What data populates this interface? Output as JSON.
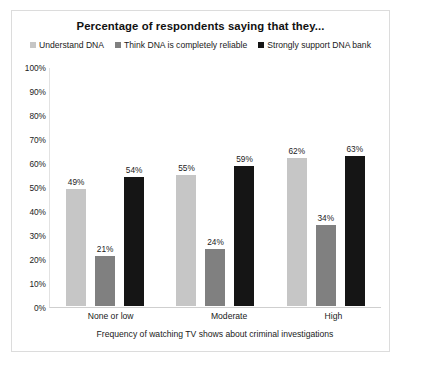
{
  "chart_data": {
    "type": "bar",
    "title": "Percentage of respondents saying that they...",
    "xlabel": "Frequency of watching TV shows about criminal investigations",
    "ylabel": "",
    "ylim": [
      0,
      100
    ],
    "grid": false,
    "legend_position": "top-center",
    "categories": [
      "None or low",
      "Moderate",
      "High"
    ],
    "y_ticks": [
      "100%",
      "90%",
      "80%",
      "70%",
      "60%",
      "50%",
      "40%",
      "30%",
      "20%",
      "10%",
      "0%"
    ],
    "series": [
      {
        "name": "Understand DNA",
        "color": "#c6c6c6",
        "values": [
          49,
          55,
          62
        ],
        "labels": [
          "49%",
          "55%",
          "62%"
        ]
      },
      {
        "name": "Think DNA is completely reliable",
        "color": "#808080",
        "values": [
          21,
          24,
          34
        ],
        "labels": [
          "21%",
          "24%",
          "34%"
        ]
      },
      {
        "name": "Strongly support DNA bank",
        "color": "#151515",
        "values": [
          54,
          59,
          63
        ],
        "labels": [
          "54%",
          "59%",
          "63%"
        ]
      }
    ]
  }
}
